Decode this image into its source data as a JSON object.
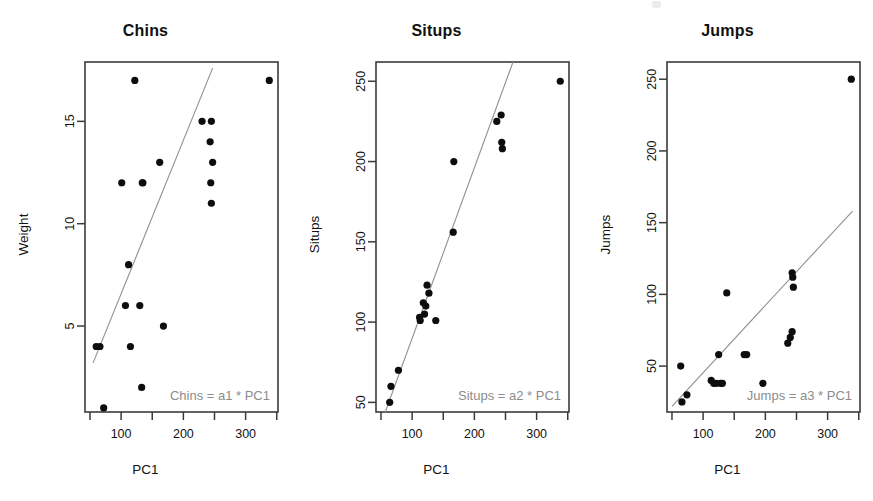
{
  "figure": {
    "background": "#ffffff",
    "point_color": "#0d0d0d",
    "line_color": "#8f8f8f",
    "frame_color": "#3b3b3b",
    "annotation_color": "#8c8c8c",
    "panel_count": 3
  },
  "panels": [
    {
      "title": "Chins",
      "xlabel": "PC1",
      "ylabel": "Weight",
      "annotation": "Chins = a1 * PC1"
    },
    {
      "title": "Situps",
      "xlabel": "PC1",
      "ylabel": "Situps",
      "annotation": "Situps = a2 * PC1"
    },
    {
      "title": "Jumps",
      "xlabel": "PC1",
      "ylabel": "Jumps",
      "annotation": "Jumps = a3 * PC1"
    }
  ],
  "chart_data": [
    {
      "type": "scatter",
      "title": "Chins",
      "xlabel": "PC1",
      "ylabel": "Weight",
      "annotation": "Chins = a1 * PC1",
      "xlim": [
        42,
        352
      ],
      "ylim": [
        0.8,
        17.9
      ],
      "xticks": [
        50,
        100,
        150,
        200,
        250,
        300,
        350
      ],
      "xticklabels": [
        "",
        "100",
        "",
        "200",
        "",
        "300",
        ""
      ],
      "yticks": [
        5,
        10,
        15
      ],
      "yticklabels": [
        "5",
        "10",
        "15"
      ],
      "grid": false,
      "legend": "none",
      "x": [
        66,
        122,
        135,
        230,
        245,
        338,
        243,
        247,
        162,
        101,
        134,
        244,
        245,
        112,
        60,
        115,
        168,
        107,
        130,
        133,
        72
      ],
      "y": [
        4.0,
        17.0,
        12.0,
        15.0,
        15.0,
        17.0,
        14.0,
        13.0,
        13.0,
        12.0,
        12.0,
        12.0,
        11.0,
        8.0,
        4.0,
        4.0,
        5.0,
        6.0,
        6.0,
        2.0,
        1.0
      ],
      "fit_line": {
        "x": [
          55,
          247
        ],
        "y": [
          3.2,
          17.6
        ],
        "note": "through-origin least squares fit of Chins on PC1"
      }
    },
    {
      "type": "scatter",
      "title": "Situps",
      "xlabel": "PC1",
      "ylabel": "Situps",
      "annotation": "Situps = a2 * PC1",
      "xlim": [
        42,
        352
      ],
      "ylim": [
        44,
        262
      ],
      "xticks": [
        50,
        100,
        150,
        200,
        250,
        300,
        350
      ],
      "xticklabels": [
        "",
        "100",
        "",
        "200",
        "",
        "300",
        ""
      ],
      "yticks": [
        50,
        100,
        150,
        200,
        250
      ],
      "yticklabels": [
        "50",
        "100",
        "150",
        "200",
        "250"
      ],
      "grid": false,
      "legend": "none",
      "x": [
        338,
        243,
        236,
        244,
        245,
        167,
        166,
        124,
        127,
        118,
        122,
        120,
        112,
        113,
        138,
        78,
        66,
        64
      ],
      "y": [
        250,
        229,
        225,
        212,
        208,
        200,
        156,
        123,
        118,
        112,
        110,
        105,
        103,
        101,
        101,
        70,
        60,
        50
      ],
      "fit_line": {
        "x": [
          55,
          262
        ],
        "y": [
          42,
          262
        ],
        "note": "through-origin least squares fit of Situps on PC1"
      }
    },
    {
      "type": "scatter",
      "title": "Jumps",
      "xlabel": "PC1",
      "ylabel": "Jumps",
      "annotation": "Jumps = a3 * PC1",
      "xlim": [
        42,
        352
      ],
      "ylim": [
        18,
        262
      ],
      "xticks": [
        50,
        100,
        150,
        200,
        250,
        300,
        350
      ],
      "xticklabels": [
        "",
        "100",
        "",
        "200",
        "",
        "300",
        ""
      ],
      "yticks": [
        50,
        100,
        150,
        200,
        250
      ],
      "yticklabels": [
        "50",
        "100",
        "150",
        "200",
        "250"
      ],
      "grid": false,
      "legend": "none",
      "x": [
        338,
        243,
        244,
        245,
        138,
        243,
        240,
        236,
        166,
        170,
        125,
        64,
        113,
        117,
        121,
        128,
        131,
        196,
        74,
        66
      ],
      "y": [
        250,
        115,
        112,
        105,
        101,
        74,
        70,
        66,
        58,
        58,
        58,
        50,
        40,
        38,
        38,
        38,
        38,
        38,
        30,
        25
      ],
      "fit_line": {
        "x": [
          50,
          340
        ],
        "y": [
          22,
          158
        ],
        "note": "through-origin least squares fit of Jumps on PC1"
      }
    }
  ]
}
